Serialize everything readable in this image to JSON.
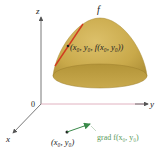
{
  "diagram": {
    "title": "",
    "surface_label": "f",
    "axes": {
      "x_label": "x",
      "y_label": "y",
      "z_label": "z",
      "origin_label": "0"
    },
    "point_on_surface_label": "(x₀, y₀, f(x₀, y₀))",
    "point_label": "(x₀, y₀)",
    "gradient_label": "grad f(x₀, y₀)",
    "colors": {
      "surface": "#c9a94a",
      "surface_dark": "#a88a33",
      "tangent_line": "#d13b1f",
      "gradient_arrow": "#3a8a4a",
      "gradient_text": "#5a9a5a",
      "axes": "#555555",
      "y_axis_tint": "#d9a0b0"
    }
  }
}
